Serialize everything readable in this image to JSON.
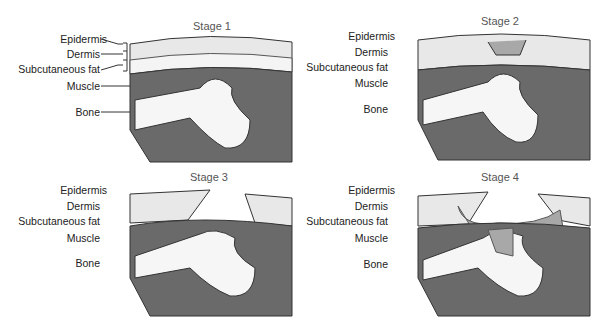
{
  "figure": {
    "panels": [
      {
        "title": "Stage 1",
        "labels": [
          "Epidermis",
          "Dermis",
          "Subcutaneous fat",
          "Muscle",
          "Bone"
        ],
        "wound": "none"
      },
      {
        "title": "Stage 2",
        "labels": [
          "Epidermis",
          "Dermis",
          "Subcutaneous fat",
          "Muscle",
          "Bone"
        ],
        "wound": "partial-thickness"
      },
      {
        "title": "Stage 3",
        "labels": [
          "Epidermis",
          "Dermis",
          "Subcutaneous fat",
          "Muscle",
          "Bone"
        ],
        "wound": "full-thickness"
      },
      {
        "title": "Stage 4",
        "labels": [
          "Epidermis",
          "Dermis",
          "Subcutaneous fat",
          "Muscle",
          "Bone"
        ],
        "wound": "to-bone"
      }
    ],
    "colors": {
      "skin": "#e8e8e8",
      "fat": "#f4f4f4",
      "muscle": "#6a6a6a",
      "bone": "#f6f6f6",
      "wound": "#a8a8a8",
      "outline": "#333333"
    }
  }
}
